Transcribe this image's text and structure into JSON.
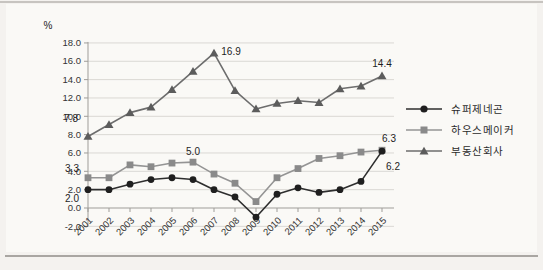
{
  "figure": {
    "type": "statistical line chart",
    "background": "#faf9f6",
    "top_rule_color": "#c7c4c0",
    "bottom_rule_color": "#a9a6a2"
  },
  "chart_data": {
    "type": "line",
    "unit_label": "%",
    "x": [
      "2001",
      "2002",
      "2003",
      "2004",
      "2005",
      "2006",
      "2007",
      "2008",
      "2009",
      "2010",
      "2011",
      "2012",
      "2013",
      "2014",
      "2015"
    ],
    "ylim": [
      -2.0,
      18.0
    ],
    "ytick_step": 2.0,
    "yticks": [
      "18.0",
      "16.0",
      "14.0",
      "12.0",
      "10.0",
      "8.0",
      "6.0",
      "4.0",
      "2.0",
      "0.0",
      "-2.0"
    ],
    "grid": "horizontal",
    "gridline_color": "#dad8d4",
    "axis_color": "#9f9d99",
    "legend_position": "right",
    "series": [
      {
        "name": "슈퍼제네곤",
        "marker": "circle",
        "color": "#1f1f1f",
        "line_color": "#2e2e2e",
        "values": [
          2.0,
          2.0,
          2.6,
          3.1,
          3.3,
          3.1,
          2.0,
          1.2,
          -1.0,
          1.5,
          2.2,
          1.7,
          2.0,
          2.9,
          6.2
        ]
      },
      {
        "name": "하우스메이커",
        "marker": "square",
        "color": "#8a8a8a",
        "line_color": "#949494",
        "values": [
          3.3,
          3.3,
          4.7,
          4.5,
          4.9,
          5.0,
          3.7,
          2.7,
          0.7,
          3.3,
          4.3,
          5.4,
          5.7,
          6.1,
          6.3
        ]
      },
      {
        "name": "부동산회사",
        "marker": "triangle",
        "color": "#5c5c5c",
        "line_color": "#6d6d6d",
        "values": [
          7.8,
          9.1,
          10.4,
          11.0,
          12.9,
          14.9,
          16.9,
          12.8,
          10.8,
          11.4,
          11.7,
          11.5,
          13.0,
          13.3,
          14.4
        ]
      }
    ],
    "point_labels": [
      {
        "series": 0,
        "x": "2001",
        "text": "2.0",
        "dx": -16,
        "dy": 9
      },
      {
        "series": 0,
        "x": "2015",
        "text": "6.2",
        "dx": 11,
        "dy": 16
      },
      {
        "series": 1,
        "x": "2001",
        "text": "3.3",
        "dx": -16,
        "dy": -9
      },
      {
        "series": 1,
        "x": "2006",
        "text": "5.0",
        "dx": 0,
        "dy": -10
      },
      {
        "series": 1,
        "x": "2015",
        "text": "6.3",
        "dx": 7,
        "dy": -11
      },
      {
        "series": 2,
        "x": "2001",
        "text": "7.8",
        "dx": -17,
        "dy": -17
      },
      {
        "series": 2,
        "x": "2007",
        "text": "16.9",
        "dx": 17,
        "dy": -1
      },
      {
        "series": 2,
        "x": "2015",
        "text": "14.4",
        "dx": 0,
        "dy": -12
      }
    ]
  }
}
